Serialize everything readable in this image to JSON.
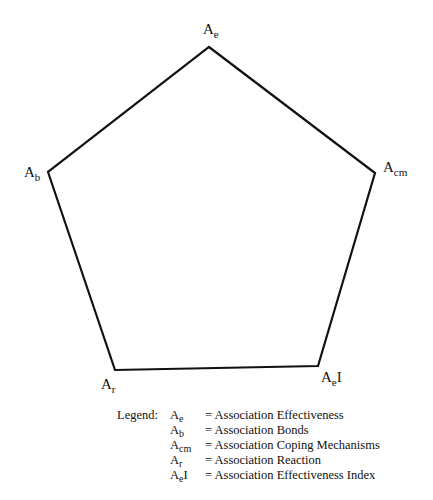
{
  "diagram": {
    "type": "pentagon",
    "stroke_color": "#111111",
    "stroke_width": 2.2,
    "vertices": [
      {
        "id": "Ae",
        "x": 209,
        "y": 47
      },
      {
        "id": "Acm",
        "x": 375,
        "y": 173
      },
      {
        "id": "AeI",
        "x": 318,
        "y": 366
      },
      {
        "id": "Ar",
        "x": 115,
        "y": 370
      },
      {
        "id": "Ab",
        "x": 48,
        "y": 172
      }
    ],
    "labels": {
      "ae": {
        "base": "A",
        "sub": "e",
        "suffix": ""
      },
      "ab": {
        "base": "A",
        "sub": "b",
        "suffix": ""
      },
      "acm": {
        "base": "A",
        "sub": "cm",
        "suffix": ""
      },
      "ar": {
        "base": "A",
        "sub": "r",
        "suffix": ""
      },
      "aei": {
        "base": "A",
        "sub": "e",
        "suffix": "I"
      }
    }
  },
  "legend": {
    "title": "Legend:",
    "items": [
      {
        "base": "A",
        "sub": "e",
        "suffix": "",
        "description": "= Association Effectiveness"
      },
      {
        "base": "A",
        "sub": "b",
        "suffix": "",
        "description": "= Association Bonds"
      },
      {
        "base": "A",
        "sub": "cm",
        "suffix": "",
        "description": "= Association Coping Mechanisms"
      },
      {
        "base": "A",
        "sub": "r",
        "suffix": "",
        "description": "= Association Reaction"
      },
      {
        "base": "A",
        "sub": "e",
        "suffix": "I",
        "description": "= Association Effectiveness Index"
      }
    ]
  }
}
